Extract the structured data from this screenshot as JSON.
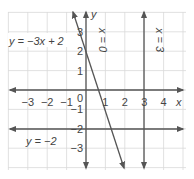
{
  "chart_data": {
    "type": "line",
    "title": "",
    "xlabel": "x",
    "ylabel": "y",
    "xlim": [
      -4,
      5
    ],
    "ylim": [
      -4,
      4
    ],
    "grid": true,
    "x_ticks": [
      "-3",
      "-2",
      "-1",
      "0",
      "1",
      "2",
      "3",
      "4"
    ],
    "y_ticks": [
      "3",
      "2",
      "1",
      "-1",
      "-2",
      "-3"
    ],
    "series": [
      {
        "name": "y = -3x + 2",
        "equation": "y = -3x + 2",
        "x": [
          -0.8,
          2
        ],
        "y": [
          4.4,
          -4
        ]
      },
      {
        "name": "x = 0",
        "equation": "x = 0",
        "x": [
          0,
          0
        ],
        "y": [
          -4,
          4
        ]
      },
      {
        "name": "x = 3",
        "equation": "x = 3",
        "x": [
          3,
          3
        ],
        "y": [
          -4,
          4
        ]
      },
      {
        "name": "y = -2",
        "equation": "y = -2",
        "x": [
          -4,
          5
        ],
        "y": [
          -2,
          -2
        ]
      }
    ]
  },
  "labels": {
    "x_axis": "x",
    "y_axis": "y",
    "eq_line": "y = −3x + 2",
    "eq_x0": "x = 0",
    "eq_x3": "x = 3",
    "eq_ym2": "y = −2"
  },
  "ticks": {
    "x": [
      {
        "v": -3,
        "t": "−3"
      },
      {
        "v": -2,
        "t": "−2"
      },
      {
        "v": -1,
        "t": "−1"
      },
      {
        "v": 1,
        "t": "1"
      },
      {
        "v": 2,
        "t": "2"
      },
      {
        "v": 3,
        "t": "3"
      },
      {
        "v": 4,
        "t": "4"
      }
    ],
    "origin": "0",
    "y": [
      {
        "v": 3,
        "t": "3"
      },
      {
        "v": 2,
        "t": "2"
      },
      {
        "v": 1,
        "t": "1"
      },
      {
        "v": -1,
        "t": "−1"
      },
      {
        "v": -2,
        "t": "−2"
      },
      {
        "v": -3,
        "t": "−3"
      }
    ]
  }
}
